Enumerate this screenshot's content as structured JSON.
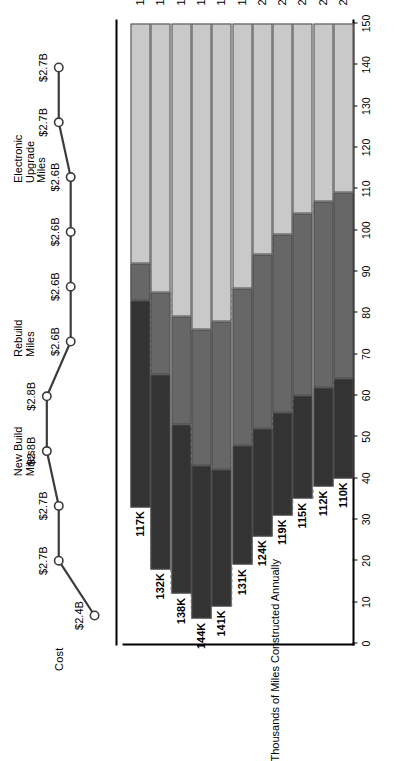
{
  "figure": {
    "cost_axis_label": "Cost",
    "bars_axis_label": "Thousands of Miles Constructed Annually"
  },
  "legend": [
    {
      "key": "new_build",
      "label_line1": "New Build",
      "label_line2": "Miles",
      "color": "#333333"
    },
    {
      "key": "rebuild",
      "label_line1": "Rebuild",
      "label_line2": "Miles",
      "color": "#676767"
    },
    {
      "key": "electronic",
      "label_line1": "Electronic",
      "label_line2": "Upgrade",
      "label_line3": "Miles",
      "color": "#c9c9c9"
    }
  ],
  "axis": {
    "tick_labels": [
      "0",
      "10",
      "20",
      "30",
      "40",
      "50",
      "60",
      "70",
      "80",
      "90",
      "100",
      "110",
      "120",
      "130",
      "140",
      "150"
    ],
    "tick_values": [
      0,
      10,
      20,
      30,
      40,
      50,
      60,
      70,
      80,
      90,
      100,
      110,
      120,
      130,
      140,
      150
    ],
    "ymin": 0,
    "ymax": 150
  },
  "chart_data": {
    "type": "bar",
    "title": "",
    "xlabel": "",
    "ylabel": "Thousands of Miles Constructed Annually",
    "ylim": [
      0,
      150
    ],
    "grid": false,
    "legend_position": "top-right",
    "orientation": "vertical-stacked",
    "categories": [
      "1994",
      "1995",
      "1996",
      "1997",
      "1998",
      "1999(e)",
      "2000(e)",
      "2001(e)",
      "2002(e)",
      "2003(e)",
      "2004(e)"
    ],
    "totals_labels": [
      "117K",
      "132K",
      "138K",
      "144K",
      "141K",
      "131K",
      "124K",
      "119K",
      "115K",
      "112K",
      "110K"
    ],
    "totals": [
      117,
      132,
      138,
      144,
      141,
      131,
      124,
      119,
      115,
      112,
      110
    ],
    "series": [
      {
        "name": "New Build Miles",
        "values": [
          50,
          47,
          41,
          37,
          33,
          29,
          26,
          25,
          25,
          24,
          24
        ]
      },
      {
        "name": "Rebuild Miles",
        "values": [
          9,
          20,
          26,
          33,
          36,
          38,
          42,
          43,
          44,
          45,
          45
        ]
      },
      {
        "name": "Electronic Upgrade Miles",
        "values": [
          58,
          65,
          71,
          74,
          72,
          64,
          56,
          51,
          46,
          43,
          41
        ]
      }
    ],
    "secondary": {
      "type": "line",
      "name": "Cost",
      "axis_label": "Cost",
      "categories": [
        "1994",
        "1995",
        "1996",
        "1997",
        "1998",
        "1999(e)",
        "2000(e)",
        "2001(e)",
        "2002(e)",
        "2003(e)",
        "2004(e)"
      ],
      "values": [
        2.4,
        2.7,
        2.7,
        2.8,
        2.8,
        2.6,
        2.6,
        2.6,
        2.6,
        2.7,
        2.7
      ],
      "labels": [
        "$2.4B",
        "$2.7B",
        "$2.7B",
        "$2.8B",
        "$2.8B",
        "$2.6B",
        "$2.6B",
        "$2.6B",
        "$2.6B",
        "$2.7B",
        "$2.7B"
      ],
      "marker": "open-circle",
      "line_color": "#3c3c3c"
    }
  }
}
